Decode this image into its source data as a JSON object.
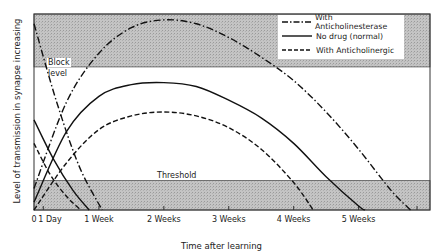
{
  "chart_data": {
    "type": "line",
    "title": "",
    "xlabel": "Time after learning",
    "ylabel": "Level of transmission in synapse increasing",
    "x_ticks": [
      {
        "label": "0",
        "week": 0
      },
      {
        "label": "1 Day",
        "week": 0.143
      },
      {
        "label": "1 Week",
        "week": 1
      },
      {
        "label": "2 Weeks",
        "week": 2
      },
      {
        "label": "3 Weeks",
        "week": 3
      },
      {
        "label": "4 Weeks",
        "week": 4
      },
      {
        "label": "5 Weeks",
        "week": 5
      }
    ],
    "bands": [
      {
        "name": "Block level",
        "label_line1": "Block",
        "label_line2": "level",
        "y_from": 0.73,
        "y_to": 1.0
      },
      {
        "name": "Threshold",
        "label": "Threshold",
        "y_from": 0.0,
        "y_to": 0.15
      }
    ],
    "legend": [
      {
        "label": "With Anticholinesterase",
        "style": "dash-dot"
      },
      {
        "label": "No drug (normal)",
        "style": "solid"
      },
      {
        "label": "With Anticholinergic",
        "style": "dashed"
      }
    ],
    "series": [
      {
        "name": "With Anticholinesterase",
        "style": "dash-dot",
        "x": [
          0,
          0.5,
          1,
          1.5,
          2,
          2.5,
          3,
          3.5,
          4,
          4.5,
          5,
          5.5,
          5.8
        ],
        "y": [
          0.11,
          0.55,
          0.8,
          0.93,
          0.97,
          0.95,
          0.88,
          0.78,
          0.66,
          0.5,
          0.31,
          0.1,
          0.0
        ]
      },
      {
        "name": "No drug (normal)",
        "style": "solid",
        "x": [
          0,
          0.5,
          1,
          1.5,
          2,
          2.5,
          3,
          3.5,
          4,
          4.5,
          5,
          5.1
        ],
        "y": [
          0.04,
          0.4,
          0.58,
          0.64,
          0.65,
          0.63,
          0.56,
          0.47,
          0.34,
          0.17,
          0.02,
          0.0
        ]
      },
      {
        "name": "With Anticholinergic",
        "style": "dashed",
        "x": [
          0,
          0.5,
          1,
          1.5,
          2,
          2.5,
          3,
          3.5,
          4,
          4.3
        ],
        "y": [
          0.0,
          0.24,
          0.41,
          0.48,
          0.5,
          0.48,
          0.42,
          0.31,
          0.14,
          0.0
        ]
      },
      {
        "name": "Short-term decay (anticholinesterase)",
        "style": "dash-dot",
        "x": [
          0,
          0.35,
          0.7,
          1.05
        ],
        "y": [
          0.95,
          0.55,
          0.22,
          0.0
        ]
      },
      {
        "name": "Short-term decay (normal)",
        "style": "solid",
        "x": [
          0,
          0.3,
          0.6,
          0.85
        ],
        "y": [
          0.46,
          0.26,
          0.1,
          0.0
        ]
      },
      {
        "name": "Short-term decay (anticholinergic)",
        "style": "dashed",
        "x": [
          0,
          0.25,
          0.5,
          0.72
        ],
        "y": [
          0.34,
          0.18,
          0.07,
          0.0
        ]
      }
    ],
    "xlim": [
      0,
      6.1
    ],
    "ylim": [
      0,
      1
    ],
    "grid": false,
    "legend_position": "upper right"
  }
}
